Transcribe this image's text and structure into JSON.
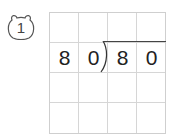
{
  "problem": {
    "number": "1",
    "badge_icon": "bear-face-icon",
    "grid": {
      "rows": 4,
      "cols": 4
    },
    "divisor": [
      "8",
      "0"
    ],
    "dividend": [
      "8",
      "0"
    ],
    "line_color": "#d6d6d6",
    "text_color": "#222222"
  }
}
